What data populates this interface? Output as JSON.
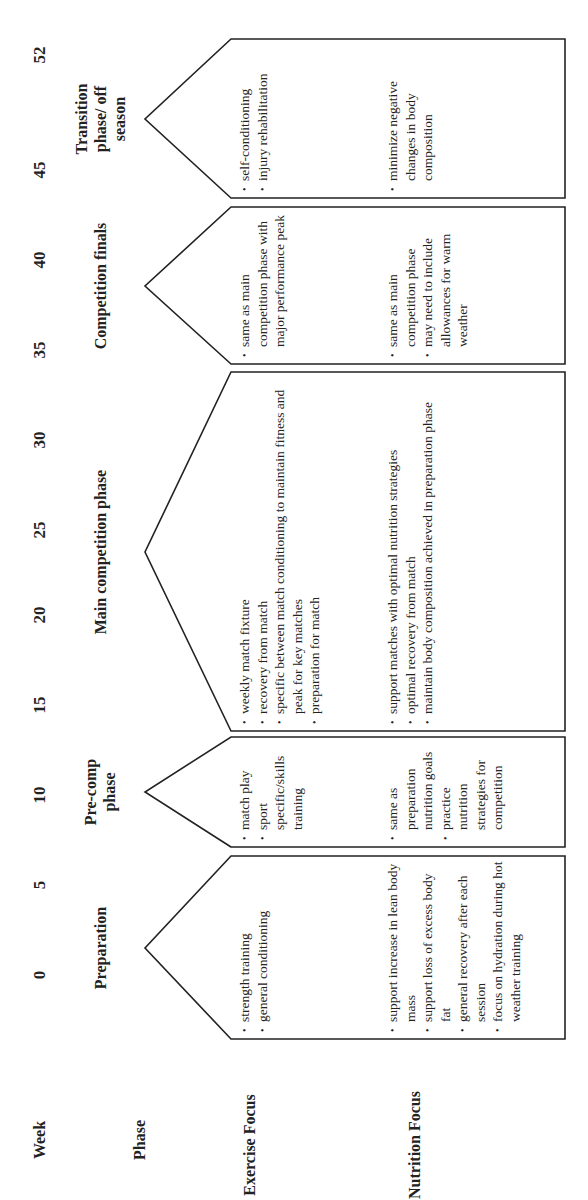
{
  "row_labels": {
    "week": "Week",
    "phase": "Phase",
    "exercise": "Exercise Focus",
    "nutrition": "Nutrition Focus"
  },
  "week_ticks": [
    "0",
    "5",
    "10",
    "15",
    "20",
    "25",
    "30",
    "35",
    "40",
    "45",
    "52"
  ],
  "phases": [
    {
      "title": "Preparation",
      "exercise": [
        "strength training",
        "general conditioning"
      ],
      "nutrition": [
        "support increase in lean body mass",
        "support loss of excess body fat",
        "general recovery after each session",
        "focus on hydration during hot weather training"
      ]
    },
    {
      "title": "Pre-comp phase",
      "exercise": [
        "match play",
        "sport specific/skills training"
      ],
      "nutrition": [
        "same as preparation nutrition goals",
        "practice nutrition strategies for competition"
      ]
    },
    {
      "title": "Main competition phase",
      "exercise": [
        "weekly match fixture",
        "recovery from match",
        "specific between match conditioning to maintain fitness and peak for key matches",
        "preparation for match"
      ],
      "nutrition": [
        "support matches with optimal nutrition strategies",
        "optimal recovery from match",
        "maintain body composition achieved in preparation phase"
      ]
    },
    {
      "title": "Competition finals",
      "exercise": [
        "same as main competition phase with major performance peak"
      ],
      "nutrition": [
        "same as main competition phase",
        "may need to include allowances for warm weather"
      ]
    },
    {
      "title": "Transition phase/ off season",
      "exercise": [
        "self-conditioning",
        "injury rehabilitation"
      ],
      "nutrition": [
        "minimize negative changes in body composition"
      ]
    }
  ],
  "colors": {
    "ink": "#222222",
    "background": "#ffffff"
  }
}
